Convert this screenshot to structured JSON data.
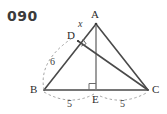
{
  "figure": {
    "problem_number": "090",
    "vertices": [
      {
        "name": "A",
        "label": "A",
        "x": 96,
        "y": 24,
        "label_x": 91,
        "label_y": 9
      },
      {
        "name": "B",
        "label": "B",
        "x": 44,
        "y": 90,
        "label_x": 30,
        "label_y": 84
      },
      {
        "name": "C",
        "label": "C",
        "x": 148,
        "y": 90,
        "label_x": 152,
        "label_y": 84
      },
      {
        "name": "D",
        "label": "D",
        "x": 78,
        "y": 41,
        "label_x": 67,
        "label_y": 30
      },
      {
        "name": "E",
        "label": "E",
        "x": 96,
        "y": 90,
        "label_x": 92,
        "label_y": 94
      }
    ],
    "segments": [
      {
        "name": "side-AB",
        "from": "A",
        "to": "B"
      },
      {
        "name": "side-AC",
        "from": "A",
        "to": "C"
      },
      {
        "name": "side-BC",
        "from": "B",
        "to": "C"
      },
      {
        "name": "altitude-AE",
        "from": "A",
        "to": "E"
      },
      {
        "name": "cevian-DC",
        "from": "D",
        "to": "C"
      }
    ],
    "right_angles": [
      {
        "name": "right-angle-at-D",
        "at": "D"
      },
      {
        "name": "right-angle-at-E",
        "at": "E"
      }
    ],
    "measures": [
      {
        "name": "segment-AD-length",
        "text": "x",
        "style": "italic",
        "x": 78,
        "y": 19
      },
      {
        "name": "segment-BD-length",
        "text": "6",
        "style": "plain",
        "x": 50,
        "y": 57
      },
      {
        "name": "segment-BE-length",
        "text": "5",
        "style": "plain",
        "x": 67,
        "y": 99
      },
      {
        "name": "segment-EC-length",
        "text": "5",
        "style": "plain",
        "x": 120,
        "y": 99
      }
    ],
    "colors": {
      "stroke": "#4a4a4a",
      "dashed": "#8a8a8a",
      "text": "#2b2b2b",
      "background": "#ffffff"
    }
  }
}
